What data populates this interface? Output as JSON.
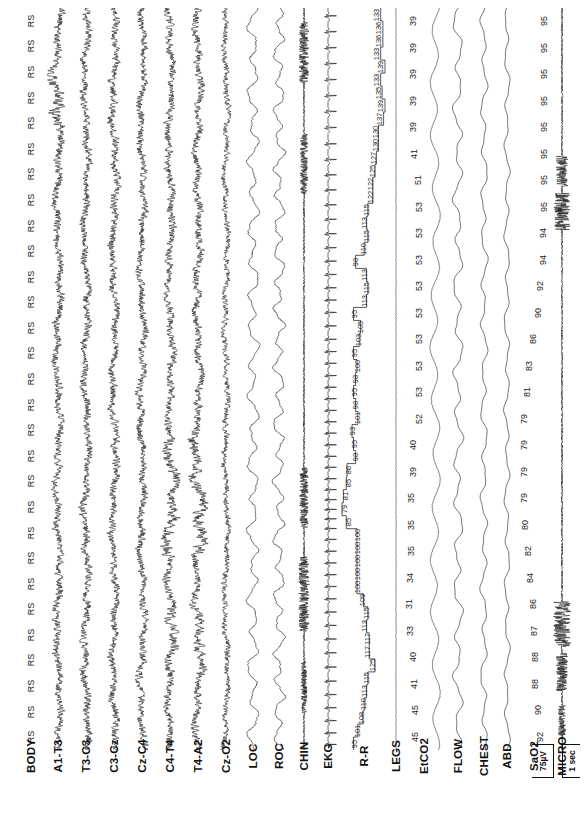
{
  "study": {
    "type": "polysomnogram",
    "orientation": "rotated-90",
    "faint_header": "",
    "scale": {
      "amplitude_label": "75µV",
      "time_label": "1 sec"
    }
  },
  "channels": [
    {
      "id": "body",
      "label": "BODY",
      "kind": "annotation",
      "x": 18,
      "w": 26
    },
    {
      "id": "a1t3",
      "label": "A1-T3",
      "kind": "eeg",
      "x": 44,
      "w": 28
    },
    {
      "id": "t3c3",
      "label": "T3-C3",
      "kind": "eeg",
      "x": 72,
      "w": 28
    },
    {
      "id": "c3cz",
      "label": "C3-Cz",
      "kind": "eeg",
      "x": 100,
      "w": 28
    },
    {
      "id": "czc4",
      "label": "Cz-C4",
      "kind": "eeg",
      "x": 128,
      "w": 28
    },
    {
      "id": "c4t4",
      "label": "C4-T4",
      "kind": "eeg",
      "x": 156,
      "w": 28
    },
    {
      "id": "t4a2",
      "label": "T4-A2",
      "kind": "eeg",
      "x": 184,
      "w": 28
    },
    {
      "id": "czo2",
      "label": "Cz-O2",
      "kind": "eeg",
      "x": 212,
      "w": 28
    },
    {
      "id": "loc",
      "label": "LOC",
      "kind": "eog",
      "x": 240,
      "w": 26
    },
    {
      "id": "roc",
      "label": "ROC",
      "kind": "eog",
      "x": 266,
      "w": 26
    },
    {
      "id": "chin",
      "label": "CHIN",
      "kind": "emg",
      "x": 292,
      "w": 24
    },
    {
      "id": "ekg",
      "label": "EKG",
      "kind": "ecg",
      "x": 316,
      "w": 24
    },
    {
      "id": "rr",
      "label": "R-R",
      "kind": "rr-step",
      "x": 340,
      "w": 48
    },
    {
      "id": "legs",
      "label": "LEGS",
      "kind": "emg-flat",
      "x": 388,
      "w": 16
    },
    {
      "id": "etco2",
      "label": "EtCO2",
      "kind": "capno",
      "x": 404,
      "w": 40
    },
    {
      "id": "flow",
      "label": "FLOW",
      "kind": "resp",
      "x": 444,
      "w": 28
    },
    {
      "id": "chest",
      "label": "CHEST",
      "kind": "resp",
      "x": 472,
      "w": 24
    },
    {
      "id": "abd",
      "label": "ABD",
      "kind": "resp",
      "x": 496,
      "w": 22
    },
    {
      "id": "sao2",
      "label": "SaO2",
      "kind": "sat",
      "x": 518,
      "w": 32
    },
    {
      "id": "micro",
      "label": "MICRO",
      "kind": "emg",
      "x": 550,
      "w": 24
    }
  ],
  "chart_data": {
    "type": "line",
    "title": "",
    "xlabel": "",
    "ylabel": "",
    "grid": false,
    "legend": "none",
    "body_position_markers": [
      "RS",
      "RS",
      "RS",
      "RS",
      "RS",
      "RS",
      "RS",
      "RS",
      "RS",
      "RS",
      "RS",
      "RS",
      "RS",
      "RS",
      "RS",
      "RS",
      "RS",
      "RS",
      "RS",
      "RS",
      "RS",
      "RS",
      "RS",
      "RS",
      "RS",
      "RS",
      "RS",
      "RS",
      "RS"
    ],
    "series": [
      {
        "name": "EtCO2",
        "unit": "mmHg",
        "values": [
          39,
          39,
          39,
          39,
          39,
          41,
          51,
          53,
          53,
          53,
          53,
          53,
          53,
          53,
          53,
          52,
          40,
          39,
          35,
          35,
          35,
          34,
          31,
          33,
          40,
          41,
          45,
          45
        ]
      },
      {
        "name": "SaO2",
        "unit": "%",
        "values": [
          95,
          95,
          95,
          95,
          95,
          95,
          95,
          95,
          94,
          94,
          92,
          90,
          86,
          83,
          81,
          79,
          79,
          79,
          79,
          80,
          82,
          84,
          86,
          87,
          88,
          88,
          90,
          92
        ]
      },
      {
        "name": "R-R",
        "unit": "ms",
        "values": [
          133,
          136,
          136,
          133,
          139,
          133,
          135,
          139,
          137,
          130,
          130,
          127,
          125,
          122,
          122,
          115,
          113,
          115,
          110,
          98,
          113,
          115,
          113,
          95,
          105,
          103,
          95,
          100,
          98,
          95,
          98,
          101,
          93,
          95,
          98,
          86,
          85,
          81,
          79,
          85,
          100,
          100,
          100,
          100,
          100,
          109,
          115,
          113,
          117,
          117,
          125,
          115,
          113,
          110,
          108,
          101,
          95
        ]
      }
    ],
    "annotations": [
      {
        "label": "75µV",
        "kind": "amplitude-scale"
      },
      {
        "label": "1 sec",
        "kind": "time-scale"
      }
    ]
  }
}
